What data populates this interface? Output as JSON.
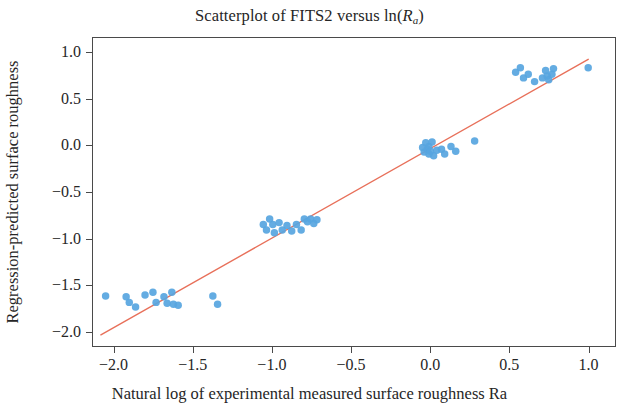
{
  "chart_data": {
    "type": "scatter",
    "title": "Scatterplot of FITS2 versus ln(Ra)",
    "title_parts": {
      "prefix": "Scatterplot of FITS2 versus ln(",
      "var": "R",
      "sub": "a",
      "suffix": ")"
    },
    "xlabel": "Natural log of experimental measured surface roughness Ra",
    "ylabel": "Regression-predicted surface roughness",
    "xlim": [
      -2.13,
      1.18
    ],
    "ylim": [
      -2.17,
      1.15
    ],
    "xticks": [
      -2.0,
      -1.5,
      -1.0,
      -0.5,
      0.0,
      0.5,
      1.0
    ],
    "xtick_labels": [
      "−2.0",
      "−1.5",
      "−1.0",
      "−0.5",
      "0.0",
      "0.5",
      "1.0"
    ],
    "yticks": [
      1.0,
      0.5,
      0.0,
      -0.5,
      -1.0,
      -1.5,
      -2.0
    ],
    "ytick_labels": [
      "1.0",
      "0.5",
      "0.0",
      "−0.5",
      "−1.0",
      "−1.5",
      "−2.0"
    ],
    "grid": false,
    "legend": null,
    "marker_color": "#57a5e0",
    "marker_size": 7.5,
    "marker_opacity": 0.92,
    "line_color": "#e8705a",
    "line_width": 1.4,
    "frame_color": "#4a4a4a",
    "fit_line": {
      "name": "Regression fit",
      "x": [
        -2.08,
        1.01
      ],
      "y": [
        -2.05,
        0.92
      ]
    },
    "series": [
      {
        "name": "FITS2 vs ln(Ra)",
        "points": [
          [
            -2.05,
            -1.63
          ],
          [
            -1.92,
            -1.64
          ],
          [
            -1.9,
            -1.7
          ],
          [
            -1.86,
            -1.75
          ],
          [
            -1.8,
            -1.62
          ],
          [
            -1.75,
            -1.59
          ],
          [
            -1.73,
            -1.7
          ],
          [
            -1.68,
            -1.64
          ],
          [
            -1.66,
            -1.71
          ],
          [
            -1.63,
            -1.59
          ],
          [
            -1.62,
            -1.72
          ],
          [
            -1.59,
            -1.73
          ],
          [
            -1.37,
            -1.63
          ],
          [
            -1.34,
            -1.72
          ],
          [
            -1.05,
            -0.86
          ],
          [
            -1.03,
            -0.92
          ],
          [
            -1.01,
            -0.8
          ],
          [
            -0.99,
            -0.86
          ],
          [
            -0.98,
            -0.95
          ],
          [
            -0.95,
            -0.84
          ],
          [
            -0.93,
            -0.92
          ],
          [
            -0.9,
            -0.87
          ],
          [
            -0.87,
            -0.93
          ],
          [
            -0.84,
            -0.86
          ],
          [
            -0.81,
            -0.92
          ],
          [
            -0.79,
            -0.8
          ],
          [
            -0.77,
            -0.83
          ],
          [
            -0.75,
            -0.8
          ],
          [
            -0.73,
            -0.85
          ],
          [
            -0.71,
            -0.81
          ],
          [
            -0.04,
            -0.03
          ],
          [
            -0.03,
            -0.08
          ],
          [
            -0.02,
            0.02
          ],
          [
            -0.01,
            -0.05
          ],
          [
            0.0,
            -0.1
          ],
          [
            0.0,
            -0.02
          ],
          [
            0.01,
            -0.07
          ],
          [
            0.02,
            0.03
          ],
          [
            0.03,
            -0.12
          ],
          [
            0.05,
            -0.06
          ],
          [
            0.08,
            -0.05
          ],
          [
            0.1,
            -0.1
          ],
          [
            0.14,
            -0.02
          ],
          [
            0.17,
            -0.07
          ],
          [
            0.29,
            0.04
          ],
          [
            0.55,
            0.78
          ],
          [
            0.58,
            0.83
          ],
          [
            0.6,
            0.72
          ],
          [
            0.63,
            0.76
          ],
          [
            0.67,
            0.68
          ],
          [
            0.72,
            0.72
          ],
          [
            0.74,
            0.8
          ],
          [
            0.75,
            0.74
          ],
          [
            0.76,
            0.7
          ],
          [
            0.78,
            0.76
          ],
          [
            0.79,
            0.82
          ],
          [
            1.01,
            0.83
          ]
        ]
      }
    ]
  }
}
